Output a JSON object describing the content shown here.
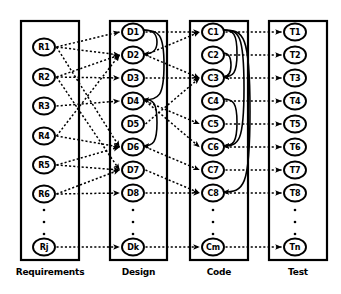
{
  "figure": {
    "background_color": "#ffffff",
    "line_color": "#000000"
  },
  "columns": [
    {
      "id": "requirements",
      "label": "Requirements",
      "x": 21,
      "y": 21,
      "width": 58,
      "height": 239,
      "node_cx": 44,
      "nodes": [
        {
          "id": "R1",
          "label": "R1",
          "cy": 47
        },
        {
          "id": "R2",
          "label": "R2",
          "cy": 77
        },
        {
          "id": "R3",
          "label": "R3",
          "cy": 106
        },
        {
          "id": "R4",
          "label": "R4",
          "cy": 136
        },
        {
          "id": "R5",
          "label": "R5",
          "cy": 165
        },
        {
          "id": "R6",
          "label": "R6",
          "cy": 194
        },
        {
          "id": "Rj",
          "label": "Rj",
          "cy": 247
        }
      ],
      "ellipsis_dots": [
        210,
        222,
        234
      ]
    },
    {
      "id": "design",
      "label": "Design",
      "x": 110,
      "y": 21,
      "width": 57,
      "height": 239,
      "node_cx": 133,
      "nodes": [
        {
          "id": "D1",
          "label": "D1",
          "cy": 32
        },
        {
          "id": "D2",
          "label": "D2",
          "cy": 55
        },
        {
          "id": "D3",
          "label": "D3",
          "cy": 78
        },
        {
          "id": "D4",
          "label": "D4",
          "cy": 101
        },
        {
          "id": "D5",
          "label": "D5",
          "cy": 124
        },
        {
          "id": "D6",
          "label": "D6",
          "cy": 147
        },
        {
          "id": "D7",
          "label": "D7",
          "cy": 170
        },
        {
          "id": "D8",
          "label": "D8",
          "cy": 193
        },
        {
          "id": "Dk",
          "label": "Dk",
          "cy": 247
        }
      ],
      "ellipsis_dots": [
        210,
        222,
        234
      ]
    },
    {
      "id": "code",
      "label": "Code",
      "x": 190,
      "y": 21,
      "width": 58,
      "height": 239,
      "node_cx": 213,
      "nodes": [
        {
          "id": "C1",
          "label": "C1",
          "cy": 32
        },
        {
          "id": "C2",
          "label": "C2",
          "cy": 55
        },
        {
          "id": "C3",
          "label": "C3",
          "cy": 78
        },
        {
          "id": "C4",
          "label": "C4",
          "cy": 101
        },
        {
          "id": "C5",
          "label": "C5",
          "cy": 124
        },
        {
          "id": "C6",
          "label": "C6",
          "cy": 147
        },
        {
          "id": "C7",
          "label": "C7",
          "cy": 170
        },
        {
          "id": "C8",
          "label": "C8",
          "cy": 193
        },
        {
          "id": "Cm",
          "label": "Cm",
          "cy": 247
        }
      ],
      "ellipsis_dots": [
        210,
        222,
        234
      ]
    },
    {
      "id": "test",
      "label": "Test",
      "x": 269,
      "y": 21,
      "width": 58,
      "height": 239,
      "node_cx": 295,
      "nodes": [
        {
          "id": "T1",
          "label": "T1",
          "cy": 32
        },
        {
          "id": "T2",
          "label": "T2",
          "cy": 55
        },
        {
          "id": "T3",
          "label": "T3",
          "cy": 78
        },
        {
          "id": "T4",
          "label": "T4",
          "cy": 101
        },
        {
          "id": "T5",
          "label": "T5",
          "cy": 124
        },
        {
          "id": "T6",
          "label": "T6",
          "cy": 147
        },
        {
          "id": "T7",
          "label": "T7",
          "cy": 170
        },
        {
          "id": "T8",
          "label": "T8",
          "cy": 193
        },
        {
          "id": "Tn",
          "label": "Tn",
          "cy": 247
        }
      ],
      "ellipsis_dots": [
        210,
        222,
        234
      ]
    }
  ],
  "node_shape": {
    "rx": 11,
    "ry": 8.5
  },
  "label_y": 275,
  "trace_links": [
    {
      "from": "R1",
      "to": "D1"
    },
    {
      "from": "R1",
      "to": "D2"
    },
    {
      "from": "R1",
      "to": "D6"
    },
    {
      "from": "R2",
      "to": "D2"
    },
    {
      "from": "R2",
      "to": "D3"
    },
    {
      "from": "R2",
      "to": "D7"
    },
    {
      "from": "R3",
      "to": "D4"
    },
    {
      "from": "R4",
      "to": "D2"
    },
    {
      "from": "R4",
      "to": "D6"
    },
    {
      "from": "R5",
      "to": "D6"
    },
    {
      "from": "R5",
      "to": "D7"
    },
    {
      "from": "R6",
      "to": "D7"
    },
    {
      "from": "R6",
      "to": "D8"
    },
    {
      "from": "Rj",
      "to": "Dk"
    },
    {
      "from": "D1",
      "to": "C1"
    },
    {
      "from": "D2",
      "to": "C1"
    },
    {
      "from": "D2",
      "to": "C3"
    },
    {
      "from": "D3",
      "to": "C3"
    },
    {
      "from": "D4",
      "to": "C5"
    },
    {
      "from": "D4",
      "to": "C6"
    },
    {
      "from": "D5",
      "to": "C3"
    },
    {
      "from": "D6",
      "to": "C7"
    },
    {
      "from": "D7",
      "to": "C8"
    },
    {
      "from": "D8",
      "to": "C8"
    },
    {
      "from": "Dk",
      "to": "Cm"
    },
    {
      "from": "C1",
      "to": "T1"
    },
    {
      "from": "C2",
      "to": "T2"
    },
    {
      "from": "C3",
      "to": "T3"
    },
    {
      "from": "C4",
      "to": "T4"
    },
    {
      "from": "C5",
      "to": "T5"
    },
    {
      "from": "C6",
      "to": "T6"
    },
    {
      "from": "C7",
      "to": "T7"
    },
    {
      "from": "C8",
      "to": "T8"
    },
    {
      "from": "Cm",
      "to": "Tn"
    }
  ],
  "intra_links": [
    {
      "from": "D1",
      "to": "D2",
      "offset": 13
    },
    {
      "from": "D1",
      "to": "D4",
      "offset": 20
    },
    {
      "from": "D4",
      "to": "D6",
      "offset": 13
    },
    {
      "from": "C1",
      "to": "C3",
      "offset": 13
    },
    {
      "from": "C1",
      "to": "C8",
      "offset": 26
    },
    {
      "from": "C2",
      "to": "C3",
      "offset": 7
    },
    {
      "from": "C4",
      "to": "C6",
      "offset": 13
    },
    {
      "from": "C1",
      "to": "C6",
      "offset": 20
    }
  ]
}
